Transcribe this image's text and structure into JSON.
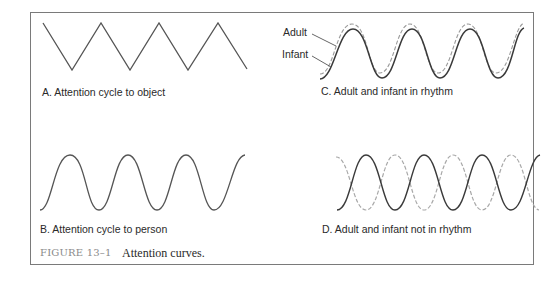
{
  "figure": {
    "number": "FIGURE 13–1",
    "title": "Attention curves."
  },
  "panels": {
    "a": {
      "label": "A. Attention cycle to object",
      "curve": "zigzag"
    },
    "b": {
      "label": "B. Attention cycle to person",
      "curve": "sine"
    },
    "c": {
      "label": "C. Adult and infant in rhythm",
      "legend": {
        "adult": "Adult",
        "infant": "Infant"
      },
      "curve": "two sines in phase"
    },
    "d": {
      "label": "D. Adult and infant not in rhythm",
      "curve": "two sines out of phase"
    }
  },
  "colors": {
    "border": "#7a7a7a",
    "solid_line": "#3a3a3a",
    "dashed_line": "#9a9a9a",
    "caption_figure": "#8a8a8a",
    "text": "#2a2a2a"
  }
}
